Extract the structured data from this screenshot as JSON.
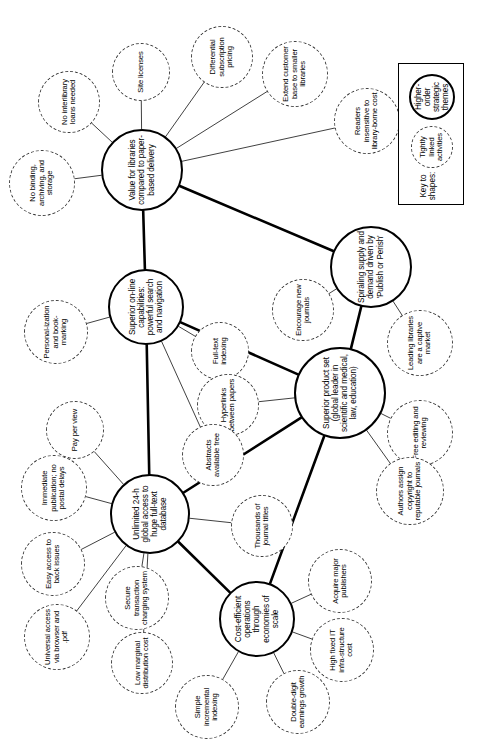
{
  "diagram": {
    "type": "mind-map",
    "orientation": "rotated-90-ccw",
    "colors": {
      "theme_stroke": "#000000",
      "activity_stroke": "#3a3a3a",
      "background": "#ffffff",
      "text": "#000000"
    }
  },
  "legend": {
    "title": "Key to shapes:",
    "items": [
      {
        "id": "legend-theme",
        "label": "Higher-order strategic themes",
        "shape": "solid-circle"
      },
      {
        "id": "legend-activity",
        "label": "Tightly linked activities",
        "shape": "dashed-circle"
      }
    ]
  },
  "themes": [
    {
      "id": "value-libraries",
      "label": "Value for libraries compared to paper-based delivery",
      "x": 580,
      "y": 142,
      "r": 41
    },
    {
      "id": "spiraling-supply",
      "label": "Spiraling supply and demand driven by 'Publish or Perish'",
      "x": 483,
      "y": 371,
      "r": 41
    },
    {
      "id": "superior-product",
      "label": "Superior product set (global leader in scientific and medical, law, education)",
      "x": 357,
      "y": 340,
      "r": 46
    },
    {
      "id": "superior-online",
      "label": "Superior on-line capabilities: powerful search and navigation",
      "x": 443,
      "y": 146,
      "r": 38
    },
    {
      "id": "unlimited-access",
      "label": "Unlimited 24-h global access to huge full-text database",
      "x": 236,
      "y": 150,
      "r": 40
    },
    {
      "id": "cost-efficient",
      "label": "Cost-efficient operations through economies of scale",
      "x": 131,
      "y": 257,
      "r": 38
    }
  ],
  "activities": [
    {
      "id": "readers-insensitive",
      "label": "Readers insensitive to library-borne cost",
      "x": 629,
      "y": 367,
      "r": 33,
      "parent": "value-libraries"
    },
    {
      "id": "extend-customer-base",
      "label": "Extend customer base to smaller libraries",
      "x": 676,
      "y": 295,
      "r": 33,
      "parent": "value-libraries"
    },
    {
      "id": "differential-pricing",
      "label": "Differential subscription pricing",
      "x": 693,
      "y": 222,
      "r": 31,
      "parent": "value-libraries"
    },
    {
      "id": "site-licenses",
      "label": "Site licenses",
      "x": 678,
      "y": 141,
      "r": 29,
      "parent": "value-libraries"
    },
    {
      "id": "no-interlibrary-loans",
      "label": "No interlibrary loans needed",
      "x": 648,
      "y": 69,
      "r": 31,
      "parent": "value-libraries"
    },
    {
      "id": "no-binding",
      "label": "No binding, archiving, and storage",
      "x": 567,
      "y": 42,
      "r": 33,
      "parent": "value-libraries"
    },
    {
      "id": "leading-libraries",
      "label": "Leading libraries are a captive market",
      "x": 407,
      "y": 420,
      "r": 33,
      "parent": "spiraling-supply"
    },
    {
      "id": "encourage-journals",
      "label": "Encourage new journals",
      "x": 440,
      "y": 303,
      "r": 31,
      "parent": "spiraling-supply"
    },
    {
      "id": "full-text-indexing",
      "label": "Full-text indexing",
      "x": 399,
      "y": 220,
      "r": 29,
      "parent": "superior-online"
    },
    {
      "id": "free-editing",
      "label": "Free editing and reviewing",
      "x": 317,
      "y": 420,
      "r": 33,
      "parent": "superior-product"
    },
    {
      "id": "authors-assign",
      "label": "Authors assign copyright to reputable journals",
      "x": 259,
      "y": 410,
      "r": 34,
      "parent": "superior-product"
    },
    {
      "id": "hyperlinks",
      "label": "Hyperlinks between papers",
      "x": 345,
      "y": 228,
      "r": 31,
      "parent": "superior-product"
    },
    {
      "id": "abstracts-free",
      "label": "Abstracts available free",
      "x": 295,
      "y": 213,
      "r": 31,
      "parent": "superior-online"
    },
    {
      "id": "personalization",
      "label": "Personal-ization and book-marking",
      "x": 418,
      "y": 56,
      "r": 32,
      "parent": "superior-online"
    },
    {
      "id": "pay-per-view",
      "label": "Pay per view",
      "x": 320,
      "y": 75,
      "r": 29,
      "parent": "unlimited-access"
    },
    {
      "id": "immediate-publication",
      "label": "Immediate publication; no postal delays",
      "x": 262,
      "y": 54,
      "r": 33,
      "parent": "unlimited-access"
    },
    {
      "id": "easy-back-issues",
      "label": "Easy access to back issues",
      "x": 186,
      "y": 53,
      "r": 32,
      "parent": "unlimited-access"
    },
    {
      "id": "universal-access",
      "label": "Universal access via browser and .pdf",
      "x": 113,
      "y": 57,
      "r": 33,
      "parent": "unlimited-access"
    },
    {
      "id": "low-marginal",
      "label": "Low marginal distribution cost",
      "x": 87,
      "y": 142,
      "r": 31,
      "parent": "unlimited-access"
    },
    {
      "id": "secure-transaction",
      "label": "Secure transaction charging system",
      "x": 152,
      "y": 137,
      "r": 32,
      "parent": "unlimited-access"
    },
    {
      "id": "thousands-journals",
      "label": "Thousands of journal titles",
      "x": 224,
      "y": 262,
      "r": 31,
      "parent": "unlimited-access"
    },
    {
      "id": "acquire-publishers",
      "label": "Acquire major publishers",
      "x": 169,
      "y": 340,
      "r": 32,
      "parent": "cost-efficient"
    },
    {
      "id": "high-fixed-cost",
      "label": "High fixed IT infra-structure cost",
      "x": 100,
      "y": 342,
      "r": 32,
      "parent": "cost-efficient"
    },
    {
      "id": "double-digit",
      "label": "Double-digit earnings growth",
      "x": 48,
      "y": 298,
      "r": 32,
      "parent": "cost-efficient"
    },
    {
      "id": "simple-indexing",
      "label": "Simple incremental indexing",
      "x": 43,
      "y": 207,
      "r": 32,
      "parent": "cost-efficient"
    }
  ],
  "theme_links": [
    {
      "from": "value-libraries",
      "to": "spiraling-supply"
    },
    {
      "from": "value-libraries",
      "to": "superior-online"
    },
    {
      "from": "spiraling-supply",
      "to": "superior-product"
    },
    {
      "from": "superior-product",
      "to": "superior-online"
    },
    {
      "from": "superior-product",
      "to": "unlimited-access"
    },
    {
      "from": "superior-product",
      "to": "cost-efficient"
    },
    {
      "from": "superior-online",
      "to": "unlimited-access"
    },
    {
      "from": "unlimited-access",
      "to": "cost-efficient"
    }
  ]
}
